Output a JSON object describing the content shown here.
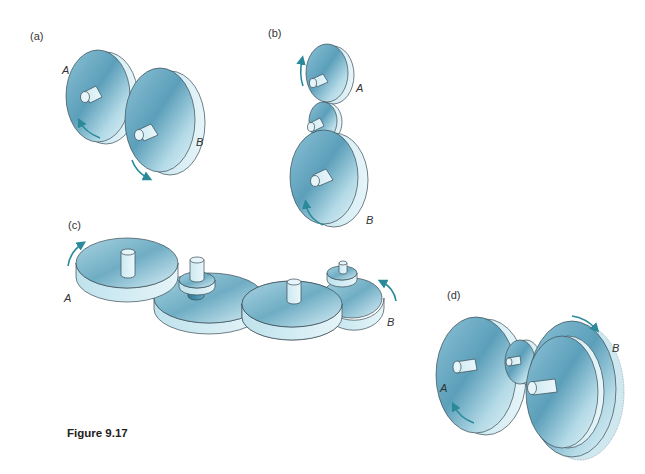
{
  "figure": {
    "caption": "Figure 9.17",
    "panels": [
      {
        "id": "a",
        "label": "(a)",
        "gears": [
          "A",
          "B"
        ]
      },
      {
        "id": "b",
        "label": "(b)",
        "gears": [
          "A",
          "B"
        ]
      },
      {
        "id": "c",
        "label": "(c)",
        "gears": [
          "A",
          "B"
        ]
      },
      {
        "id": "d",
        "label": "(d)",
        "gears": [
          "A",
          "B"
        ]
      }
    ]
  },
  "colors": {
    "gear_face_light": "#d8eef5",
    "gear_face_dark": "#5fa3bd",
    "gear_rim": "#c8e6ef",
    "arrow": "#2a8a9a"
  }
}
